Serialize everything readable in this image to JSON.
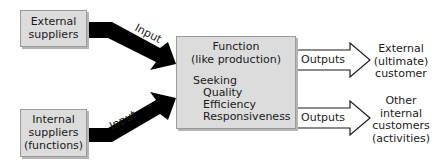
{
  "diagram": {
    "sources": [
      {
        "id": "external-suppliers",
        "label_lines": [
          "External",
          "suppliers"
        ]
      },
      {
        "id": "internal-suppliers",
        "label_lines": [
          "Internal",
          "suppliers",
          "(functions)"
        ]
      }
    ],
    "input_label": "Input",
    "function_box": {
      "title_lines": [
        "Function",
        "(like production)"
      ],
      "seeking_label": "Seeking",
      "seeking_items": [
        "Quality",
        "Efficiency",
        "Responsiveness"
      ]
    },
    "output_label": "Outputs",
    "destinations": [
      {
        "id": "external-customer",
        "label_lines": [
          "External",
          "(ultimate)",
          "customer"
        ]
      },
      {
        "id": "internal-customers",
        "label_lines": [
          "Other",
          "internal",
          "customers",
          "(activities)"
        ]
      }
    ],
    "colors": {
      "box_fill": "#dcdcdc",
      "box_border": "#9a9a9a",
      "arrow_fill": "#000000",
      "outline_arrow": "#1a1a1a"
    }
  }
}
